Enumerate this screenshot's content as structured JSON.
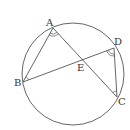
{
  "diagram": {
    "type": "circle-geometry",
    "stroke_color": "#555555",
    "circle": {
      "cx": 73,
      "cy": 74,
      "r": 51
    },
    "points": {
      "A": {
        "x": 53,
        "y": 28,
        "label": "A",
        "lx": 46,
        "ly": 26
      },
      "B": {
        "x": 23,
        "y": 82,
        "label": "B",
        "lx": 14,
        "ly": 86
      },
      "C": {
        "x": 117,
        "y": 97,
        "label": "C",
        "lx": 118,
        "ly": 105
      },
      "D": {
        "x": 114,
        "y": 48,
        "label": "D",
        "lx": 114,
        "ly": 45
      },
      "E": {
        "x": 80,
        "y": 61,
        "label": "E",
        "lx": 77,
        "ly": 71
      }
    },
    "segments": [
      [
        "A",
        "B"
      ],
      [
        "A",
        "C"
      ],
      [
        "B",
        "D"
      ],
      [
        "D",
        "C"
      ]
    ],
    "angle_marks": [
      {
        "vertex": "A",
        "arcs": 2
      },
      {
        "vertex": "D",
        "arcs": 2
      },
      {
        "vertex": "B",
        "arcs": 1
      },
      {
        "vertex": "C",
        "arcs": 1
      }
    ]
  }
}
